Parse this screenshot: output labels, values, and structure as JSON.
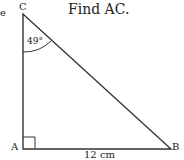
{
  "title": "Find AC.",
  "partial_left_char": "e",
  "triangle": {
    "vertices": {
      "C": "C",
      "A": "A",
      "B": "B"
    },
    "angle_C": "49°",
    "side_AB": "12 cm",
    "right_angle_at": "A"
  }
}
